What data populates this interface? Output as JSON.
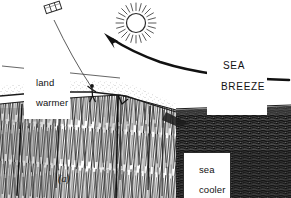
{
  "figure": {
    "panel_label": "(a)",
    "style": "pen-and-ink line illustration",
    "ink_color": "#1a1a1a",
    "paper_color": "#ffffff"
  },
  "labels": {
    "land": "land",
    "land_state": "warmer",
    "sea_breeze_line1": "SEA",
    "sea_breeze_line2": "BREEZE",
    "sea": "sea",
    "sea_state": "cooler"
  },
  "elements": {
    "kite": "kite-icon",
    "kite_string": "kite-string",
    "person": "person-figure",
    "sun": "sun-icon",
    "sun_rays": 24,
    "breeze_arrow": "curved-arrow-icon",
    "horizon_line": "horizon-line",
    "cliff": "cliff-hatching",
    "sea_surface": "sea-texture"
  },
  "colors": {
    "ink": "#1a1a1a",
    "line": "#3a3a3a",
    "sea_dark": "#2e2e2e",
    "sea_mid": "#585858",
    "land_stipple": "#8a8a8a",
    "paper": "#ffffff"
  }
}
